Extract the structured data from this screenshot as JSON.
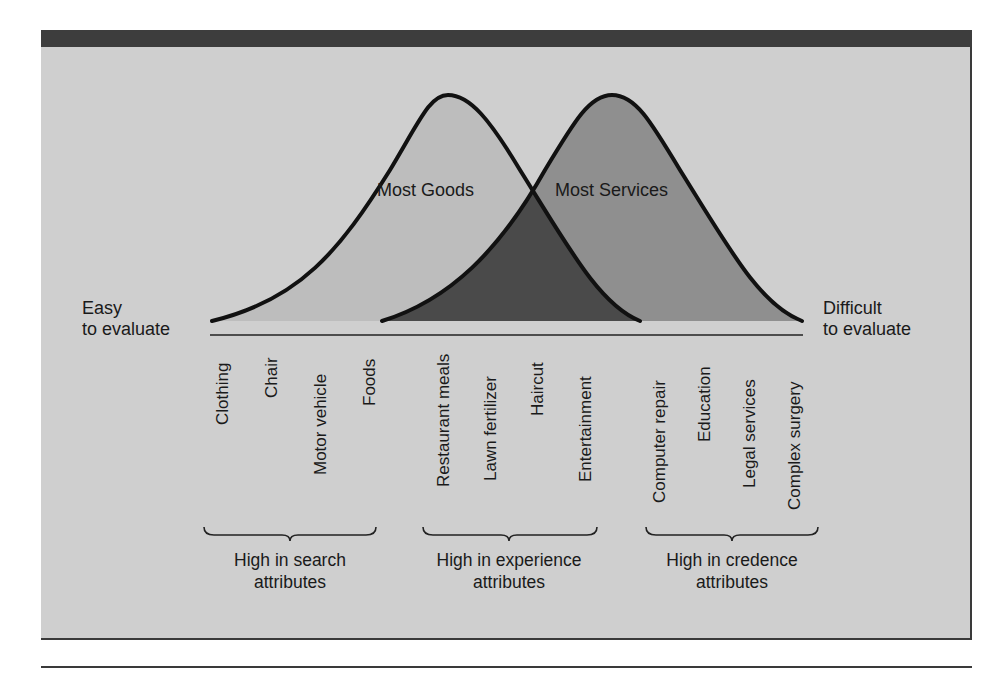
{
  "colors": {
    "background": "#cfcfcf",
    "top_bar": "#3d3d3d",
    "goods_fill": "#bdbdbd",
    "services_fill": "#8f8f8f",
    "overlap_fill": "#4a4a4a",
    "stroke": "#111111"
  },
  "curves": {
    "goods_label": "Most Goods",
    "services_label": "Most Services"
  },
  "axis": {
    "left_label_line1": "Easy",
    "left_label_line2": "to evaluate",
    "right_label_line1": "Difficult",
    "right_label_line2": "to evaluate"
  },
  "items": [
    {
      "label": "Clothing"
    },
    {
      "label": "Chair"
    },
    {
      "label": "Motor vehicle"
    },
    {
      "label": "Foods"
    },
    {
      "label": "Restaurant meals"
    },
    {
      "label": "Lawn fertilizer"
    },
    {
      "label": "Haircut"
    },
    {
      "label": "Entertainment"
    },
    {
      "label": "Computer repair"
    },
    {
      "label": "Education"
    },
    {
      "label": "Legal services"
    },
    {
      "label": "Complex surgery"
    }
  ],
  "groups": [
    {
      "line1": "High in search",
      "line2": "attributes"
    },
    {
      "line1": "High in experience",
      "line2": "attributes"
    },
    {
      "line1": "High in credence",
      "line2": "attributes"
    }
  ]
}
